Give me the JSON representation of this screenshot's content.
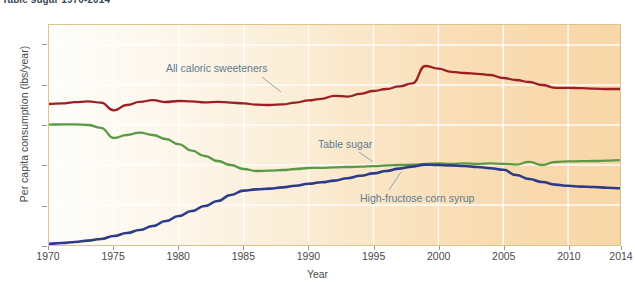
{
  "chart_data": {
    "type": "line",
    "title": "Table sugar 1970-2014",
    "xlabel": "Year",
    "ylabel": "Per capita consumption (lbs/year)",
    "xlim": [
      1970,
      2014
    ],
    "ylim": [
      0,
      110
    ],
    "xticks": [
      1970,
      1975,
      1980,
      1985,
      1990,
      1995,
      2000,
      2005,
      2010,
      2014
    ],
    "yticks": [
      0,
      20,
      40,
      60,
      80,
      100
    ],
    "grid": "white gridlines, horizontal and vertical",
    "legend": "none (inline curve annotations)",
    "x": [
      1970,
      1971,
      1972,
      1973,
      1974,
      1975,
      1976,
      1977,
      1978,
      1979,
      1980,
      1981,
      1982,
      1983,
      1984,
      1985,
      1986,
      1987,
      1988,
      1989,
      1990,
      1991,
      1992,
      1993,
      1994,
      1995,
      1996,
      1997,
      1998,
      1999,
      2000,
      2001,
      2002,
      2003,
      2004,
      2005,
      2006,
      2007,
      2008,
      2009,
      2010,
      2011,
      2012,
      2013,
      2014
    ],
    "series": [
      {
        "name": "All caloric sweeteners",
        "color": "#9c1f23",
        "annotation": "All caloric sweeteners",
        "values": [
          70.5,
          70.8,
          71.4,
          71.8,
          71.2,
          67.3,
          70.0,
          71.6,
          72.4,
          71.5,
          72.0,
          71.8,
          71.3,
          71.6,
          71.2,
          70.8,
          70.2,
          70.0,
          70.3,
          71.2,
          72.3,
          73.1,
          74.6,
          74.2,
          75.6,
          77.0,
          78.0,
          79.3,
          80.8,
          89.5,
          88.2,
          86.6,
          86.0,
          85.6,
          85.0,
          83.5,
          82.5,
          81.5,
          80.0,
          78.6,
          78.6,
          78.4,
          78.2,
          78.0,
          78.0
        ]
      },
      {
        "name": "Table sugar",
        "color": "#5a9a46",
        "annotation": "Table sugar",
        "values": [
          60.2,
          60.3,
          60.3,
          60.0,
          58.6,
          53.5,
          55.0,
          56.2,
          55.0,
          53.0,
          50.4,
          47.2,
          44.5,
          42.0,
          40.0,
          38.0,
          37.0,
          37.2,
          37.5,
          38.0,
          38.5,
          38.6,
          38.8,
          39.0,
          39.2,
          39.4,
          39.8,
          40.0,
          40.2,
          40.5,
          40.8,
          40.6,
          40.8,
          40.6,
          40.8,
          40.6,
          40.2,
          41.6,
          40.0,
          41.5,
          41.8,
          41.9,
          42.0,
          42.2,
          42.4
        ]
      },
      {
        "name": "High-fructose corn syrup",
        "color": "#2e3b8a",
        "annotation": "High-fructose corn syrup",
        "values": [
          0.6,
          1.0,
          1.5,
          2.2,
          3.0,
          4.5,
          6.0,
          7.5,
          9.5,
          12.0,
          14.5,
          17.0,
          19.5,
          22.0,
          25.0,
          27.2,
          27.8,
          28.2,
          28.8,
          29.6,
          30.6,
          31.4,
          32.2,
          33.4,
          34.6,
          35.8,
          37.0,
          38.2,
          39.2,
          40.2,
          40.0,
          39.8,
          39.5,
          39.0,
          38.4,
          37.6,
          35.0,
          33.0,
          31.5,
          30.2,
          29.6,
          29.2,
          29.0,
          28.6,
          28.4
        ]
      }
    ]
  },
  "caption_strip": ""
}
